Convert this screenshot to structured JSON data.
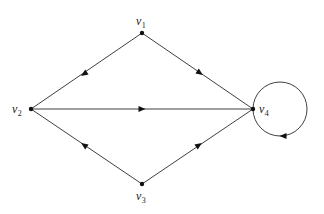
{
  "diagram": {
    "type": "directed-graph",
    "nodes": [
      {
        "id": "v1",
        "label": "v",
        "subscript": "1",
        "x": 142,
        "y": 33,
        "label_x": 136,
        "label_y": 25
      },
      {
        "id": "v2",
        "label": "v",
        "subscript": "2",
        "x": 31,
        "y": 109,
        "label_x": 12,
        "label_y": 113
      },
      {
        "id": "v3",
        "label": "v",
        "subscript": "3",
        "x": 142,
        "y": 184,
        "label_x": 136,
        "label_y": 200
      },
      {
        "id": "v4",
        "label": "v",
        "subscript": "4",
        "x": 253,
        "y": 109,
        "label_x": 259,
        "label_y": 113
      }
    ],
    "edges": [
      {
        "from": "v1",
        "to": "v2",
        "arrow_at": [
          84,
          74
        ]
      },
      {
        "from": "v1",
        "to": "v4",
        "arrow_at": [
          200,
          73
        ]
      },
      {
        "from": "v2",
        "to": "v4",
        "arrow_at": [
          142,
          109
        ]
      },
      {
        "from": "v3",
        "to": "v2",
        "arrow_at": [
          84,
          145
        ]
      },
      {
        "from": "v3",
        "to": "v4",
        "arrow_at": [
          199,
          145
        ]
      },
      {
        "from": "v4",
        "to": "v4",
        "loop": true,
        "center": [
          280,
          109
        ],
        "radius": 27,
        "arrow_at": [
          283,
          136
        ],
        "direction": "left"
      }
    ]
  }
}
